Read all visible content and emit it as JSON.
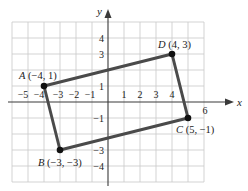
{
  "diagram": {
    "type": "coordinate-plane-quadrilateral",
    "axes": {
      "x_label": "x",
      "y_label": "y",
      "x_ticks": [
        "−5",
        "−4",
        "−3",
        "−2",
        "−1",
        "1",
        "2",
        "3",
        "4",
        "6"
      ],
      "x_tick_values": [
        -5,
        -4,
        -3,
        -2,
        -1,
        1,
        2,
        3,
        4,
        6
      ],
      "y_ticks": [
        "4",
        "3",
        "1",
        "−1",
        "−3",
        "−4"
      ],
      "y_tick_values": [
        4,
        3,
        1,
        -1,
        -3,
        -4
      ],
      "x_range": [
        -6,
        6
      ],
      "y_range": [
        -5,
        5
      ]
    },
    "points": [
      {
        "name": "A",
        "coords": "(−4, 1)",
        "x": -4,
        "y": 1
      },
      {
        "name": "B",
        "coords": "(−3, −3)",
        "x": -3,
        "y": -3
      },
      {
        "name": "C",
        "coords": "(5, −1)",
        "x": 5,
        "y": -1
      },
      {
        "name": "D",
        "coords": "(4, 3)",
        "x": 4,
        "y": 3
      }
    ],
    "colors": {
      "grid": "#c8c8c8",
      "edges": "#4a4a4a",
      "points": "#111111",
      "axes": "#3a3a3a"
    }
  }
}
